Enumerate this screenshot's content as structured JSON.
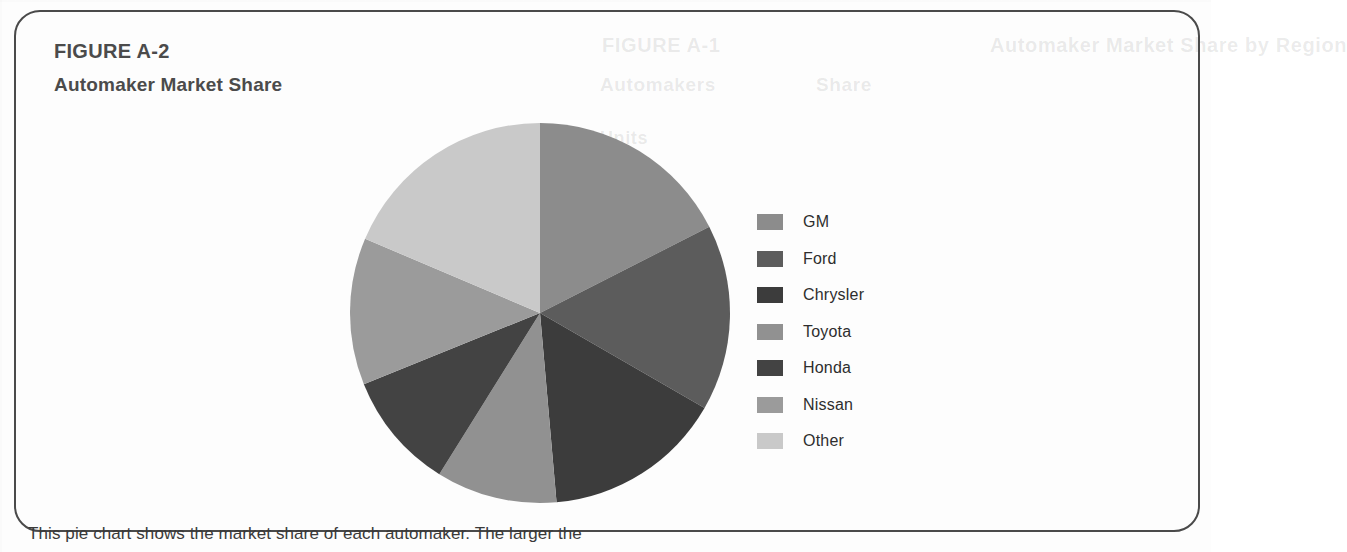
{
  "figure": {
    "label": "FIGURE A-2",
    "title": "Automaker Market Share",
    "border_color": "#4a4a4a",
    "heading_color": "#4b4b4b"
  },
  "caption": {
    "text": "This pie chart shows the market share of each automaker. The larger the"
  },
  "ghost_text": {
    "line1": "FIGURE A-1",
    "line2": "Automaker Market Share by Region",
    "line3": "Automakers",
    "line4": "Share",
    "line5": "Units"
  },
  "legend": {
    "items": [
      {
        "label": "GM",
        "color": "#8c8c8c"
      },
      {
        "label": "Ford",
        "color": "#5c5c5c"
      },
      {
        "label": "Chrysler",
        "color": "#3c3c3c"
      },
      {
        "label": "Toyota",
        "color": "#919191"
      },
      {
        "label": "Honda",
        "color": "#434343"
      },
      {
        "label": "Nissan",
        "color": "#9b9b9b"
      },
      {
        "label": "Other",
        "color": "#c9c9c9"
      }
    ]
  },
  "chart_data": {
    "type": "pie",
    "title": "Automaker Market Share",
    "subtitle": "FIGURE A-2",
    "categories": [
      "GM",
      "Ford",
      "Chrysler",
      "Toyota",
      "Honda",
      "Nissan",
      "Other"
    ],
    "values": [
      17.5,
      15.8,
      15.3,
      10.3,
      10.0,
      12.5,
      18.6
    ],
    "unit": "percent",
    "start_angle_deg": 0,
    "direction": "clockwise",
    "colors": [
      "#8c8c8c",
      "#5c5c5c",
      "#3c3c3c",
      "#919191",
      "#434343",
      "#9b9b9b",
      "#c9c9c9"
    ],
    "slice_boundaries_deg": [
      0,
      63,
      120,
      175,
      212,
      248,
      293,
      360
    ],
    "legend_position": "right",
    "grid": false,
    "labels_shown": false,
    "center": {
      "x": 531,
      "y": 334
    },
    "radius": 188
  }
}
